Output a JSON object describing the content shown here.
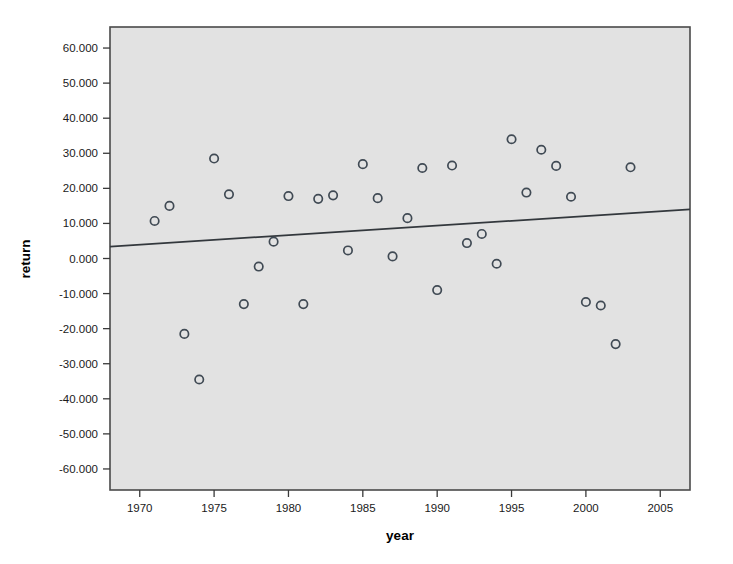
{
  "chart_data": {
    "type": "scatter",
    "title": "",
    "xlabel": "year",
    "ylabel": "return",
    "xlim": [
      1968,
      2007
    ],
    "ylim": [
      -66,
      66
    ],
    "grid": false,
    "legend": "none",
    "x_ticks": [
      1970,
      1975,
      1980,
      1985,
      1990,
      1995,
      2000,
      2005
    ],
    "x_tick_labels": [
      "1970",
      "1975",
      "1980",
      "1985",
      "1990",
      "1995",
      "2000",
      "2005"
    ],
    "y_ticks": [
      60,
      50,
      40,
      30,
      20,
      10,
      0,
      -10,
      -20,
      -30,
      -40,
      -50,
      -60
    ],
    "y_tick_labels": [
      "60.000",
      "50.000",
      "40.000",
      "30.000",
      "20.000",
      "10.000",
      "0.000",
      "-10.000",
      "-20.000",
      "-30.000",
      "-40.000",
      "-50.000",
      "-60.000"
    ],
    "marker": "open-circle",
    "marker_color": "#404a54",
    "plot_background": "#e2e2e2",
    "x": [
      1971,
      1972,
      1973,
      1974,
      1975,
      1976,
      1977,
      1978,
      1979,
      1980,
      1981,
      1982,
      1983,
      1984,
      1985,
      1986,
      1987,
      1988,
      1989,
      1990,
      1991,
      1992,
      1993,
      1994,
      1995,
      1996,
      1997,
      1998,
      1999,
      2000,
      2001,
      2002,
      2003
    ],
    "y": [
      10.7,
      15.0,
      -21.5,
      -34.5,
      28.5,
      18.3,
      -13.0,
      -2.3,
      4.8,
      17.8,
      -13.0,
      17.0,
      18.0,
      2.3,
      26.9,
      17.2,
      0.6,
      11.5,
      25.8,
      -9.0,
      26.5,
      4.4,
      7.0,
      -1.5,
      34.0,
      18.8,
      31.0,
      26.4,
      17.6,
      -12.4,
      -13.4,
      -24.4,
      26.0
    ],
    "points": [
      {
        "year": 1971,
        "return": 10.7
      },
      {
        "year": 1972,
        "return": 15.0
      },
      {
        "year": 1973,
        "return": -21.5
      },
      {
        "year": 1974,
        "return": -34.5
      },
      {
        "year": 1975,
        "return": 28.5
      },
      {
        "year": 1976,
        "return": 18.3
      },
      {
        "year": 1977,
        "return": -13.0
      },
      {
        "year": 1978,
        "return": -2.3
      },
      {
        "year": 1979,
        "return": 4.8
      },
      {
        "year": 1980,
        "return": 17.8
      },
      {
        "year": 1981,
        "return": -13.0
      },
      {
        "year": 1982,
        "return": 17.0
      },
      {
        "year": 1983,
        "return": 18.0
      },
      {
        "year": 1984,
        "return": 2.3
      },
      {
        "year": 1985,
        "return": 26.9
      },
      {
        "year": 1986,
        "return": 17.2
      },
      {
        "year": 1987,
        "return": 0.6
      },
      {
        "year": 1988,
        "return": 11.5
      },
      {
        "year": 1989,
        "return": 25.8
      },
      {
        "year": 1990,
        "return": -9.0
      },
      {
        "year": 1991,
        "return": 26.5
      },
      {
        "year": 1992,
        "return": 4.4
      },
      {
        "year": 1993,
        "return": 7.0
      },
      {
        "year": 1994,
        "return": -1.5
      },
      {
        "year": 1995,
        "return": 34.0
      },
      {
        "year": 1996,
        "return": 18.8
      },
      {
        "year": 1997,
        "return": 31.0
      },
      {
        "year": 1998,
        "return": 26.4
      },
      {
        "year": 1999,
        "return": 17.6
      },
      {
        "year": 2000,
        "return": -12.4
      },
      {
        "year": 2001,
        "return": -13.4
      },
      {
        "year": 2002,
        "return": -24.4
      },
      {
        "year": 2003,
        "return": 26.0
      }
    ],
    "fit_line": {
      "type": "linear-regression",
      "x_start": 1968,
      "y_start": 3.4,
      "x_end": 2007,
      "y_end": 14.0
    }
  }
}
